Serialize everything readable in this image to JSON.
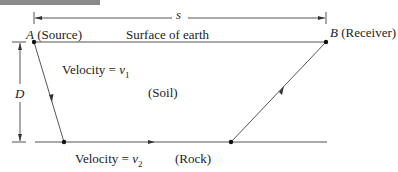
{
  "diagram": {
    "labels": {
      "distance": "s",
      "depth": "D",
      "point_a": "A",
      "point_a_desc": "(Source)",
      "point_b": "B",
      "point_b_desc": "(Receiver)",
      "surface": "Surface of earth",
      "layer1_velocity_prefix": "Velocity = ",
      "layer1_velocity_var": "v",
      "layer1_velocity_sub": "1",
      "layer1_material": "(Soil)",
      "layer2_velocity_prefix": "Velocity = ",
      "layer2_velocity_var": "v",
      "layer2_velocity_sub": "2",
      "layer2_material": "(Rock)"
    },
    "colors": {
      "line": "#555555",
      "point": "#111111",
      "header": "#8a8a8a"
    }
  }
}
